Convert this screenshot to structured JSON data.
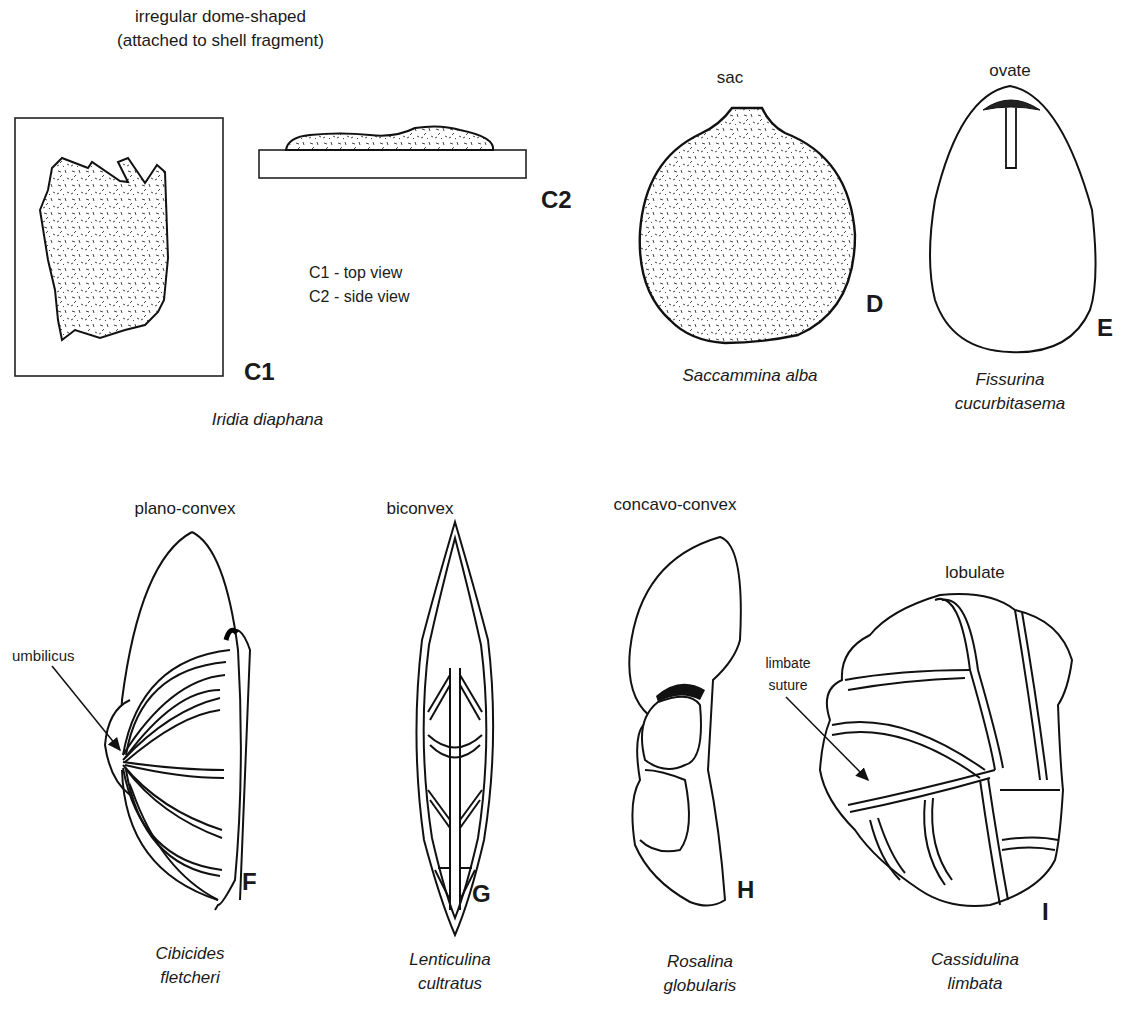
{
  "figures": [
    {
      "id": "C",
      "shape": "irregular dome-shaped",
      "shape_note": "(attached to shell fragment)",
      "species": "Iridia diaphana",
      "letters": [
        "C1",
        "C2"
      ],
      "views": [
        "C1 - top view",
        "C2 - side view"
      ]
    },
    {
      "id": "D",
      "shape": "sac",
      "species": "Saccammina alba",
      "letter": "D"
    },
    {
      "id": "E",
      "shape": "ovate",
      "species_line1": "Fissurina",
      "species_line2": "cucurbitasema",
      "letter": "E"
    },
    {
      "id": "F",
      "shape": "plano-convex",
      "species_line1": "Cibicides",
      "species_line2": "fletcheri",
      "letter": "F",
      "annotation": "umbilicus"
    },
    {
      "id": "G",
      "shape": "biconvex",
      "species_line1": "Lenticulina",
      "species_line2": "cultratus",
      "letter": "G"
    },
    {
      "id": "H",
      "shape": "concavo-convex",
      "species_line1": "Rosalina",
      "species_line2": "globularis",
      "letter": "H"
    },
    {
      "id": "I",
      "shape": "lobulate",
      "species_line1": "Cassidulina",
      "species_line2": "limbata",
      "letter": "I",
      "annotation_line1": "limbate",
      "annotation_line2": "suture"
    }
  ]
}
